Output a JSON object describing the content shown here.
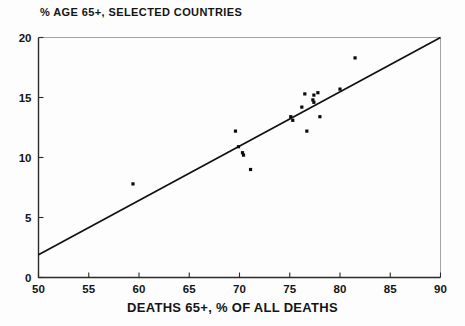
{
  "chart_data": {
    "type": "scatter",
    "title": "% AGE 65+, SELECTED COUNTRIES",
    "xlabel": "DEATHS 65+, % OF ALL DEATHS",
    "ylabel": "",
    "xlim": [
      50,
      90
    ],
    "ylim": [
      0,
      20
    ],
    "xticks": [
      50,
      55,
      60,
      65,
      70,
      75,
      80,
      85,
      90
    ],
    "yticks": [
      0,
      5,
      10,
      15,
      20
    ],
    "xtick_labels": [
      "50",
      "55",
      "60",
      "65",
      "70",
      "75",
      "80",
      "85",
      "90"
    ],
    "ytick_labels": [
      "0",
      "5",
      "10",
      "15",
      "20"
    ],
    "grid": false,
    "legend": null,
    "series": [
      {
        "name": "countries",
        "marker": "square-dot",
        "color": "#0b0b0b",
        "points": [
          {
            "x": 59.4,
            "y": 7.8
          },
          {
            "x": 69.6,
            "y": 12.2
          },
          {
            "x": 69.9,
            "y": 10.9
          },
          {
            "x": 70.3,
            "y": 10.4
          },
          {
            "x": 70.4,
            "y": 10.2
          },
          {
            "x": 71.1,
            "y": 9.0
          },
          {
            "x": 75.1,
            "y": 13.4
          },
          {
            "x": 75.3,
            "y": 13.1
          },
          {
            "x": 76.2,
            "y": 14.2
          },
          {
            "x": 76.5,
            "y": 15.3
          },
          {
            "x": 76.7,
            "y": 12.2
          },
          {
            "x": 77.3,
            "y": 14.8
          },
          {
            "x": 77.4,
            "y": 14.6
          },
          {
            "x": 77.4,
            "y": 15.2
          },
          {
            "x": 77.8,
            "y": 15.4
          },
          {
            "x": 78.0,
            "y": 13.4
          },
          {
            "x": 80.0,
            "y": 15.7
          },
          {
            "x": 81.5,
            "y": 18.3
          }
        ]
      }
    ],
    "fit_line": {
      "name": "regression-line",
      "color": "#101010",
      "x0": 50,
      "y0": 1.9,
      "x1": 90,
      "y1": 20.0
    }
  }
}
